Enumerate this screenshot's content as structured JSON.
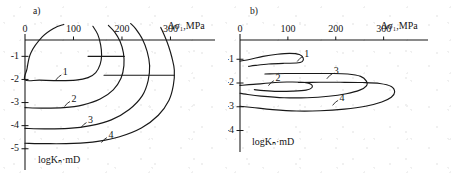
{
  "figure": {
    "background_color": "#ffffff",
    "ink_color": "#181818"
  },
  "chart_data": [
    {
      "type": "line",
      "panel": "a",
      "panel_label": "a)",
      "title": "",
      "xlabel": "Δσ₁,MPa",
      "ylabel": "logKₙ·mD",
      "xlim": [
        0,
        330
      ],
      "ylim": [
        -5.4,
        0.4
      ],
      "grid": false,
      "legend": "inline curve numbers",
      "xticks": [
        0,
        100,
        200,
        300
      ],
      "xtick_labels": [
        "0",
        "100",
        "200",
        "300"
      ],
      "yticks": [
        -1,
        -2,
        -3,
        -4,
        -5
      ],
      "ytick_labels": [
        "-1",
        "-2",
        "-3",
        "-4",
        "-5"
      ],
      "series": [
        {
          "name": "1",
          "label": "1",
          "label_x": 78,
          "label_y": -1.72,
          "points": [
            [
              80,
              0.38
            ],
            [
              60,
              0.22
            ],
            [
              36,
              -0.15
            ],
            [
              12,
              -0.85
            ],
            [
              4,
              -1.55
            ],
            [
              0,
              -2.02
            ],
            [
              30,
              -2.03
            ],
            [
              70,
              -2.05
            ],
            [
              105,
              -2.03
            ],
            [
              130,
              -1.92
            ],
            [
              146,
              -1.7
            ],
            [
              155,
              -1.35
            ],
            [
              158,
              -0.95
            ],
            [
              156,
              -0.5
            ],
            [
              150,
              -0.05
            ],
            [
              140,
              0.3
            ]
          ]
        },
        {
          "name": "2",
          "label": "2",
          "label_x": 96,
          "label_y": -2.87,
          "points": [
            [
              0,
              -3.22
            ],
            [
              35,
              -3.24
            ],
            [
              80,
              -3.22
            ],
            [
              120,
              -3.1
            ],
            [
              155,
              -2.85
            ],
            [
              182,
              -2.45
            ],
            [
              198,
              -1.95
            ],
            [
              204,
              -1.4
            ],
            [
              203,
              -0.85
            ],
            [
              196,
              -0.35
            ],
            [
              185,
              0.05
            ],
            [
              172,
              0.34
            ]
          ]
        },
        {
          "name": "3",
          "label": "3",
          "label_x": 130,
          "label_y": -3.78,
          "points": [
            [
              0,
              -4.12
            ],
            [
              40,
              -4.14
            ],
            [
              90,
              -4.12
            ],
            [
              135,
              -4.0
            ],
            [
              178,
              -3.75
            ],
            [
              215,
              -3.3
            ],
            [
              242,
              -2.7
            ],
            [
              254,
              -2.05
            ],
            [
              257,
              -1.4
            ],
            [
              252,
              -0.8
            ],
            [
              242,
              -0.25
            ],
            [
              228,
              0.2
            ],
            [
              218,
              0.42
            ]
          ]
        },
        {
          "name": "4",
          "label": "4",
          "label_x": 172,
          "label_y": -4.43,
          "points": [
            [
              0,
              -4.76
            ],
            [
              45,
              -4.78
            ],
            [
              100,
              -4.77
            ],
            [
              150,
              -4.68
            ],
            [
              195,
              -4.48
            ],
            [
              240,
              -4.1
            ],
            [
              275,
              -3.55
            ],
            [
              297,
              -2.9
            ],
            [
              306,
              -2.25
            ],
            [
              308,
              -1.6
            ],
            [
              303,
              -1.05
            ],
            [
              296,
              -0.55
            ],
            [
              288,
              -0.12
            ],
            [
              280,
              0.25
            ]
          ]
        }
      ],
      "horizontal_markers": [
        {
          "y": -1.0,
          "x_start": 130,
          "x_end": 205
        },
        {
          "y": -1.82,
          "x_start": 163,
          "x_end": 308
        }
      ]
    },
    {
      "type": "line",
      "panel": "b",
      "panel_label": "b)",
      "title": "",
      "xlabel": "Δσ₁,MPa",
      "ylabel": "logKₙ·mD",
      "xlim": [
        0,
        330
      ],
      "ylim": [
        -4.4,
        0.4
      ],
      "grid": false,
      "legend": "inline curve numbers",
      "xticks": [
        0,
        100,
        200,
        300
      ],
      "xtick_labels": [
        "0",
        "100",
        "200",
        "300"
      ],
      "yticks": [
        -1,
        -2,
        -3,
        -4
      ],
      "ytick_labels": [
        "-1",
        "-2",
        "-3",
        "-4"
      ],
      "series": [
        {
          "name": "1",
          "label": "1",
          "label_x": 134,
          "label_y": -0.8,
          "points": [
            [
              0,
              -1.08
            ],
            [
              22,
              -1.0
            ],
            [
              48,
              -0.88
            ],
            [
              78,
              -0.79
            ],
            [
              104,
              -0.75
            ],
            [
              124,
              -0.8
            ],
            [
              132,
              -0.95
            ],
            [
              130,
              -1.1
            ],
            [
              118,
              -1.16
            ],
            [
              92,
              -1.17
            ],
            [
              60,
              -1.2
            ],
            [
              32,
              -1.26
            ],
            [
              18,
              -1.3
            ]
          ]
        },
        {
          "name": "2",
          "label": "2",
          "label_x": 74,
          "label_y": -1.82,
          "points": [
            [
              0,
              -2.1
            ],
            [
              28,
              -2.06
            ],
            [
              62,
              -2.0
            ],
            [
              98,
              -1.96
            ],
            [
              128,
              -1.97
            ],
            [
              148,
              -2.05
            ],
            [
              150,
              -2.2
            ],
            [
              138,
              -2.3
            ],
            [
              110,
              -2.34
            ],
            [
              78,
              -2.35
            ],
            [
              50,
              -2.32
            ],
            [
              30,
              -2.28
            ]
          ]
        },
        {
          "name": "3",
          "label": "3",
          "label_x": 196,
          "label_y": -1.53,
          "points": [
            [
              52,
              -1.62
            ],
            [
              95,
              -1.6
            ],
            [
              140,
              -1.6
            ],
            [
              185,
              -1.6
            ],
            [
              225,
              -1.62
            ],
            [
              252,
              -1.72
            ],
            [
              264,
              -1.92
            ],
            [
              264,
              -2.12
            ],
            [
              250,
              -2.3
            ],
            [
              222,
              -2.45
            ],
            [
              185,
              -2.56
            ],
            [
              140,
              -2.62
            ],
            [
              92,
              -2.62
            ],
            [
              44,
              -2.55
            ],
            [
              12,
              -2.47
            ],
            [
              0,
              -2.43
            ]
          ]
        },
        {
          "name": "4",
          "label": "4",
          "label_x": 208,
          "label_y": -2.65,
          "points": [
            [
              122,
              -1.98
            ],
            [
              165,
              -1.97
            ],
            [
              210,
              -1.97
            ],
            [
              255,
              -1.98
            ],
            [
              292,
              -2.02
            ],
            [
              316,
              -2.15
            ],
            [
              323,
              -2.38
            ],
            [
              316,
              -2.6
            ],
            [
              296,
              -2.8
            ],
            [
              262,
              -2.98
            ],
            [
              218,
              -3.1
            ],
            [
              168,
              -3.17
            ],
            [
              118,
              -3.18
            ],
            [
              68,
              -3.12
            ],
            [
              26,
              -3.03
            ],
            [
              0,
              -2.98
            ]
          ]
        }
      ],
      "horizontal_markers": []
    }
  ]
}
